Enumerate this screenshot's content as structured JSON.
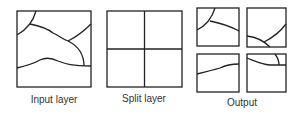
{
  "diagram": {
    "panels": [
      {
        "id": "input",
        "label": "Input layer"
      },
      {
        "id": "split",
        "label": "Split layer"
      },
      {
        "id": "output",
        "label": "Output"
      }
    ],
    "stroke_color": "#222222",
    "background": "#ffffff"
  }
}
